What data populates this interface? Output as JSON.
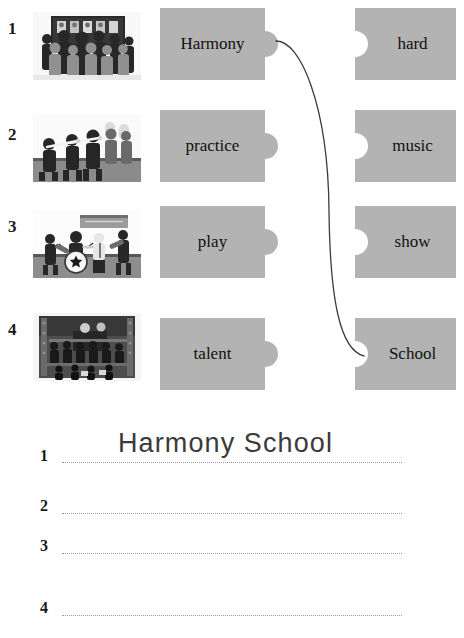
{
  "worksheet": {
    "rows": [
      {
        "number": "1",
        "image_alt": "students-in-front-of-noticeboard",
        "left_word": "Harmony",
        "right_word": "hard"
      },
      {
        "number": "2",
        "image_alt": "marching-band-playing-flutes",
        "left_word": "practice",
        "right_word": "music"
      },
      {
        "number": "3",
        "image_alt": "rock-band-on-stage",
        "left_word": "play",
        "right_word": "show"
      },
      {
        "number": "4",
        "image_alt": "choir-performing-on-risers",
        "left_word": "talent",
        "right_word": "School"
      }
    ],
    "connections": [
      {
        "from": "Harmony",
        "to": "School"
      }
    ],
    "answers": [
      {
        "number": "1",
        "text": "Harmony School"
      },
      {
        "number": "2",
        "text": ""
      },
      {
        "number": "3",
        "text": ""
      },
      {
        "number": "4",
        "text": ""
      }
    ]
  },
  "colors": {
    "piece_fill": "#b3b3b3",
    "piece_text": "#111111",
    "connector_line": "#3c3c3c",
    "dotted_line": "#9a9a9a",
    "handwriting": "#3a3a3a"
  }
}
